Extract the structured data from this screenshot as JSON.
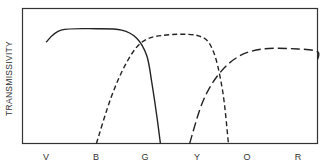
{
  "chart_data": {
    "type": "line",
    "title": "",
    "xlabel": "",
    "ylabel": "TRANSMISSIVITY",
    "categories": [
      "V",
      "B",
      "G",
      "Y",
      "O",
      "R"
    ],
    "grid": false,
    "legend": "none",
    "ylim": [
      0,
      1
    ],
    "series": [
      {
        "name": "solid",
        "style": "solid",
        "x": [
          0.0,
          0.3,
          1.0,
          1.5,
          1.8,
          2.0,
          2.1,
          2.2,
          2.27
        ],
        "values": [
          0.75,
          0.84,
          0.85,
          0.84,
          0.78,
          0.65,
          0.45,
          0.2,
          0.0
        ]
      },
      {
        "name": "short-dash",
        "style": "short-dash",
        "x": [
          1.0,
          1.3,
          1.6,
          1.9,
          2.3,
          3.0,
          3.3,
          3.5,
          3.62
        ],
        "values": [
          0.0,
          0.35,
          0.6,
          0.75,
          0.8,
          0.8,
          0.7,
          0.4,
          0.0
        ]
      },
      {
        "name": "long-dash",
        "style": "long-dash",
        "x": [
          2.85,
          3.1,
          3.4,
          3.8,
          4.3,
          5.0,
          5.5,
          5.75
        ],
        "values": [
          0.0,
          0.3,
          0.5,
          0.64,
          0.7,
          0.7,
          0.68,
          0.62
        ]
      }
    ]
  },
  "axis": {
    "ylabel": "TRANSMISSIVITY",
    "ticks": [
      "V",
      "B",
      "G",
      "Y",
      "O",
      "R"
    ]
  }
}
